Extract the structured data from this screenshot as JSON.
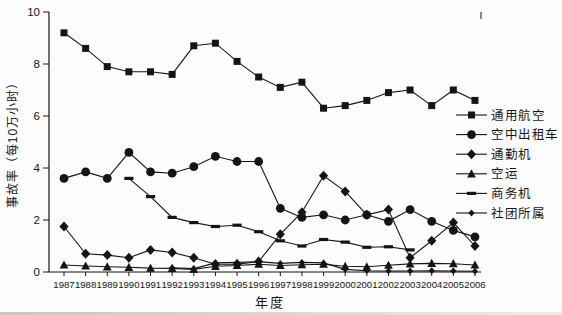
{
  "chart_data": {
    "type": "line",
    "title": "",
    "xlabel": "年度",
    "ylabel": "事故率（每10万小时）",
    "ylim": [
      0,
      10
    ],
    "yticks": [
      0,
      2,
      4,
      6,
      8,
      10
    ],
    "grid": false,
    "legend_position": "right",
    "line_color": "#151515",
    "x": [
      1987,
      1988,
      1989,
      1990,
      1991,
      1992,
      1993,
      1994,
      1995,
      1996,
      1997,
      1998,
      1999,
      2000,
      2001,
      2002,
      2003,
      2004,
      2005,
      2006
    ],
    "series": [
      {
        "name": "通用航空",
        "marker": "square",
        "values": [
          9.2,
          8.6,
          7.9,
          7.7,
          7.7,
          7.6,
          8.7,
          8.8,
          8.1,
          7.5,
          7.1,
          7.3,
          6.3,
          6.4,
          6.6,
          6.9,
          7.0,
          6.4,
          7.0,
          6.6
        ]
      },
      {
        "name": "空中出租车",
        "marker": "circle",
        "values": [
          3.6,
          3.85,
          3.6,
          4.6,
          3.85,
          3.8,
          4.05,
          4.45,
          4.25,
          4.25,
          2.45,
          2.1,
          2.2,
          2.0,
          2.2,
          1.95,
          2.4,
          1.95,
          1.6,
          1.35
        ]
      },
      {
        "name": "通勤机",
        "marker": "diamond",
        "values": [
          1.75,
          0.7,
          0.65,
          0.55,
          0.85,
          0.75,
          0.55,
          0.3,
          0.3,
          0.4,
          1.45,
          2.3,
          3.7,
          3.1,
          2.2,
          2.4,
          0.55,
          1.2,
          1.9,
          1.0
        ]
      },
      {
        "name": "空运",
        "marker": "triangle",
        "values": [
          0.27,
          0.23,
          0.2,
          0.18,
          0.15,
          0.14,
          0.1,
          0.22,
          0.25,
          0.3,
          0.25,
          0.28,
          0.3,
          0.22,
          0.2,
          0.26,
          0.31,
          0.33,
          0.32,
          0.27
        ]
      },
      {
        "name": "商务机",
        "marker": "dash",
        "values": [
          null,
          null,
          null,
          3.6,
          2.9,
          2.1,
          1.9,
          1.75,
          1.8,
          1.55,
          1.2,
          1.0,
          1.25,
          1.15,
          0.95,
          0.97,
          0.85,
          null,
          null,
          null
        ]
      },
      {
        "name": "社团所属",
        "marker": "small-diamond",
        "values": [
          null,
          null,
          null,
          null,
          null,
          0.16,
          0.13,
          0.35,
          0.37,
          0.4,
          0.33,
          0.37,
          0.35,
          0.1,
          0.05,
          0.04,
          0.04,
          0.05,
          0.04,
          0.03
        ]
      }
    ]
  }
}
